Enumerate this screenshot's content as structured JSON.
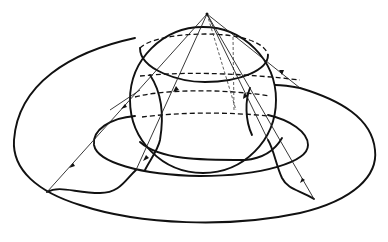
{
  "figure": {
    "elements": {
      "sphere": "sphere-outline",
      "pole": "north-pole-point",
      "outer_boundary": "outer-surface-curve",
      "inner_ellipse": "middle-ellipse",
      "rays": "projection-rays",
      "latitude_circles": "dashed-latitude-circles"
    },
    "colors": {
      "stroke": "#111111",
      "background": "#ffffff"
    }
  }
}
